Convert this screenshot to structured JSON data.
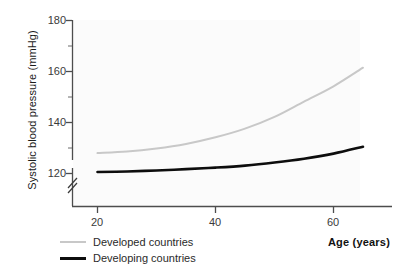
{
  "chart_data": {
    "type": "line",
    "title": "",
    "xlabel": "Age (years)",
    "ylabel": "Systolic blood pressure (mmHg)",
    "xlim": [
      16,
      66
    ],
    "ylim": [
      116,
      182
    ],
    "x_ticks": [
      20,
      40,
      60
    ],
    "y_ticks": [
      120,
      140,
      160,
      180
    ],
    "y_minor_ticks": [
      130,
      150,
      170
    ],
    "y_axis_break": true,
    "y_axis_break_label": "//",
    "grid": false,
    "legend_position": "below-left",
    "x": [
      20,
      25,
      30,
      35,
      40,
      45,
      50,
      55,
      60,
      65
    ],
    "series": [
      {
        "name": "Developed countries",
        "color": "#c8c8c8",
        "line_width": 2,
        "values": [
          128.0,
          128.6,
          129.8,
          131.6,
          134.2,
          137.6,
          142.2,
          148.2,
          154.2,
          161.5
        ]
      },
      {
        "name": "Developing countries",
        "color": "#0d0d0d",
        "line_width": 2.6,
        "values": [
          120.6,
          120.8,
          121.2,
          121.7,
          122.3,
          123.1,
          124.3,
          125.8,
          127.8,
          130.5
        ]
      }
    ]
  },
  "axes": {
    "y_title": "Systolic blood pressure (mmHg)",
    "x_title": "Age (years)",
    "y_tick_labels": [
      "180",
      "160",
      "140",
      "120"
    ],
    "x_tick_labels": [
      "20",
      "40",
      "60"
    ]
  },
  "legend": {
    "items": [
      {
        "label": "Developed countries"
      },
      {
        "label": "Developing countries"
      }
    ]
  }
}
